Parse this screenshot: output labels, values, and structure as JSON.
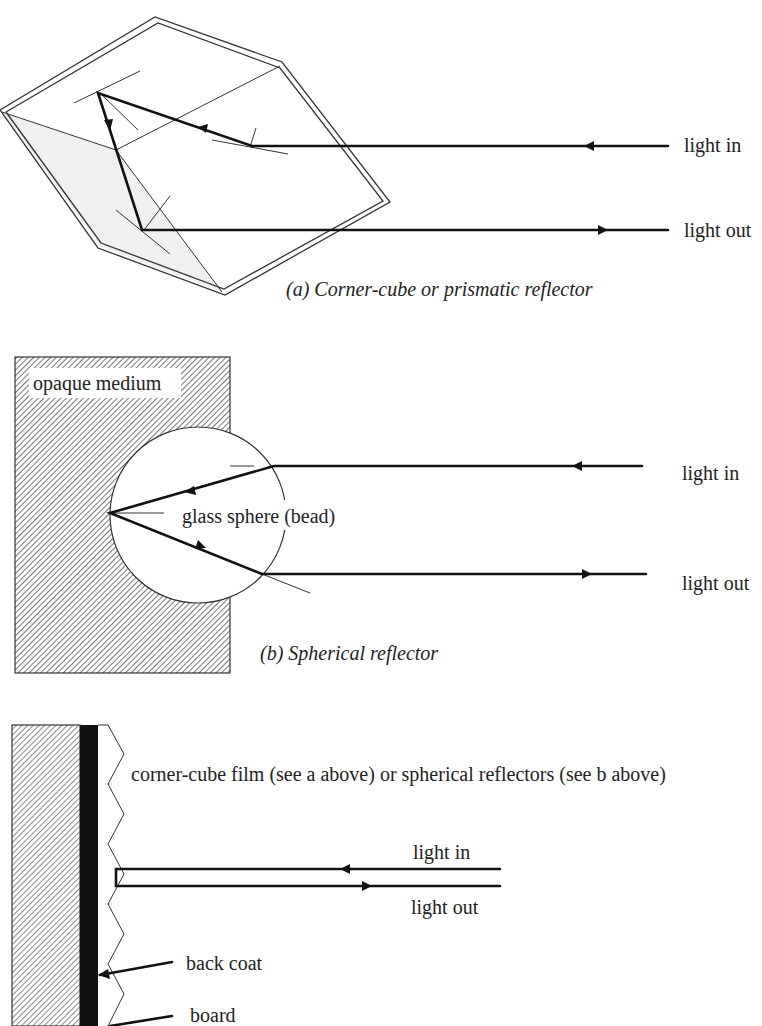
{
  "figure": {
    "panels": [
      {
        "id": "a",
        "caption": "(a) Corner-cube or prismatic reflector",
        "labels": {
          "light_in": "light in",
          "light_out": "light out"
        }
      },
      {
        "id": "b",
        "caption": "(b) Spherical reflector",
        "labels": {
          "medium": "opaque medium",
          "sphere": "glass sphere (bead)",
          "light_in": "light in",
          "light_out": "light out"
        }
      },
      {
        "id": "c",
        "labels": {
          "film": "corner-cube film (see a above) or spherical reflectors (see b above)",
          "light_in": "light in",
          "light_out": "light out",
          "back_coat": "back coat",
          "board": "board"
        }
      }
    ],
    "colors": {
      "line": "#111111",
      "thin_line": "#333333",
      "shade": "#f0f0f0",
      "hatch": "#555555",
      "background": "#ffffff"
    }
  }
}
